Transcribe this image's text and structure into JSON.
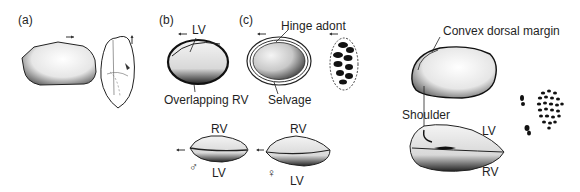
{
  "figure": {
    "panels": [
      {
        "id": "a",
        "label": "(a)"
      },
      {
        "id": "b",
        "label": "(b)"
      },
      {
        "id": "c",
        "label": "(c)"
      }
    ],
    "labels": {
      "b_lv": "LV",
      "b_overlapping": "Overlapping RV",
      "c_hinge": "Hinge adont",
      "c_selvage": "Selvage",
      "male_rv": "RV",
      "male_lv": "LV",
      "male_symbol": "♂",
      "female_rv": "RV",
      "female_lv": "LV",
      "female_symbol": "♀",
      "convex_dorsal": "Convex dorsal margin",
      "shoulder": "Shoulder",
      "right_lv": "LV",
      "right_rv": "RV"
    },
    "arrows": {
      "right": "→",
      "up": "↑",
      "left": "←"
    }
  }
}
